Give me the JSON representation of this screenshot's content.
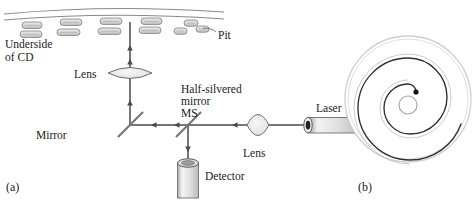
{
  "figure": {
    "panels": [
      {
        "id": "a",
        "label": "(a)",
        "caption": "Optical pickup of a CD player"
      },
      {
        "id": "b",
        "label": "(b)",
        "caption": "Spiral track on a CD"
      }
    ]
  },
  "labels": {
    "underside_of_cd_line1": "Underside",
    "underside_of_cd_line2": "of CD",
    "pit": "Pit",
    "lens_top": "Lens",
    "mirror": "Mirror",
    "half_silvered_line1": "Half-silvered",
    "half_silvered_line2": "mirror",
    "half_silvered_line3": "MS",
    "lens_bottom": "Lens",
    "laser": "Laser",
    "detector": "Detector",
    "panel_a": "(a)",
    "panel_b": "(b)"
  },
  "colors": {
    "stroke": "#3a3a3a",
    "beam": "#4a4a4a",
    "pit_fill": "#d9d9d9",
    "pit_stroke": "#808080",
    "lens_fill": "#ececec",
    "cylinder_fill": "#e8e8e8",
    "disc_outline": "#c9c9c9",
    "spiral": "#2b2b2b",
    "text": "#1a1a1a",
    "background": "#ffffff"
  },
  "diagram_a": {
    "cd_surface": {
      "description": "two curved lines representing the underside of the CD",
      "curve_top_y": 10,
      "curve_bottom_y": 17
    },
    "pits": {
      "count": 16,
      "shape": "rounded-rectangle",
      "rows": 2,
      "description": "small rounded rectangular pits on the CD underside"
    },
    "beam_paths": [
      {
        "name": "laser-to-ms",
        "from": "laser",
        "to": "half-silvered-mirror",
        "direction": "left",
        "orientation": "horizontal"
      },
      {
        "name": "ms-to-mirror",
        "from": "half-silvered-mirror",
        "to": "mirror",
        "direction": "left",
        "orientation": "horizontal"
      },
      {
        "name": "mirror-to-cd",
        "from": "mirror",
        "to": "cd-underside",
        "direction": "up",
        "orientation": "vertical"
      },
      {
        "name": "ms-to-detector",
        "from": "half-silvered-mirror",
        "to": "detector",
        "direction": "down",
        "orientation": "vertical"
      }
    ],
    "components": [
      "laser",
      "lens-bottom",
      "half-silvered-mirror",
      "mirror",
      "lens-top",
      "cd-underside",
      "detector"
    ]
  },
  "diagram_b": {
    "disc": {
      "cx": 408,
      "cy": 100,
      "r": 62,
      "center_hole_r": 9
    },
    "spiral": {
      "turns": 3.2,
      "start_marker": "black-dot-near-center",
      "description": "continuous spiral track from inner radius to outer edge"
    }
  }
}
